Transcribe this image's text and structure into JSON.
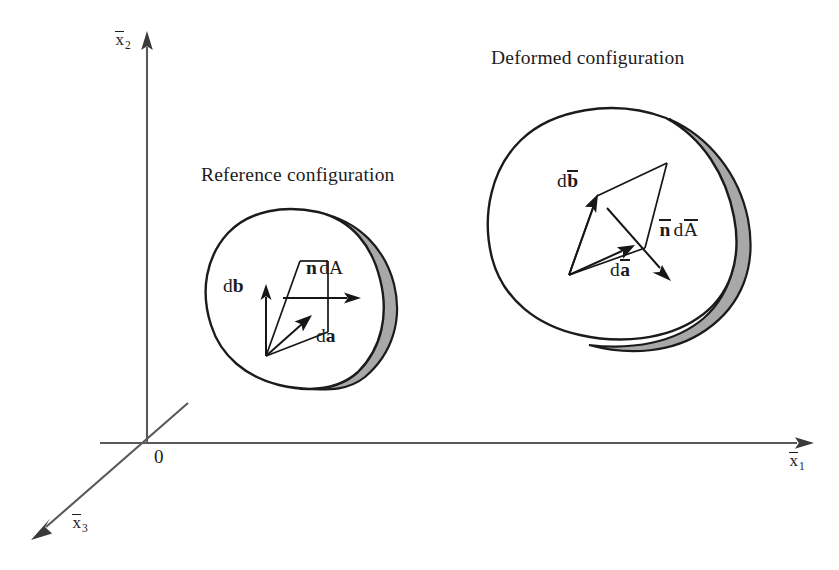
{
  "figure": {
    "background_color": "#ffffff",
    "ink_color": "#1c1c1c",
    "axis_color": "#595959",
    "band_fill_color": "#a8a8a8",
    "body_fill_color": "#ffffff"
  },
  "axes": {
    "origin_label": "0",
    "vertical": {
      "symbol": "x",
      "overbar": true,
      "subscript": "2",
      "direction": "up"
    },
    "horizontal": {
      "symbol": "x",
      "overbar": true,
      "subscript": "1",
      "direction": "right"
    },
    "oblique": {
      "symbol": "x",
      "overbar": true,
      "subscript": "3",
      "direction": "down-left"
    }
  },
  "bodies": [
    {
      "name": "reference-configuration",
      "caption": "Reference configuration",
      "vectors": [
        {
          "name": "db",
          "prefix": "d",
          "symbol": "b",
          "bold": true,
          "overbar": false,
          "direction": "up"
        },
        {
          "name": "da",
          "prefix": "d",
          "symbol": "a",
          "bold": true,
          "overbar": false,
          "direction": "up-right"
        },
        {
          "name": "ndA",
          "prefix": "",
          "symbol": "n",
          "bold": true,
          "overbar": false,
          "suffix": "dA",
          "direction": "right"
        }
      ]
    },
    {
      "name": "deformed-configuration",
      "caption": "Deformed configuration",
      "vectors": [
        {
          "name": "dbbar",
          "prefix": "d",
          "symbol": "b",
          "bold": true,
          "overbar": true,
          "direction": "up-right"
        },
        {
          "name": "dabar",
          "prefix": "d",
          "symbol": "a",
          "bold": true,
          "overbar": true,
          "direction": "up-right-shallow"
        },
        {
          "name": "nbardAbar",
          "prefix": "",
          "symbol": "n",
          "bold": true,
          "overbar": true,
          "suffix": "dA",
          "suffix_overbar": true,
          "direction": "down-right"
        }
      ]
    }
  ],
  "labels": {
    "reference_caption": "Reference configuration",
    "deformed_caption": "Deformed configuration",
    "origin": "0",
    "axis_x1_base": "x",
    "axis_x1_sub": "1",
    "axis_x2_base": "x",
    "axis_x2_sub": "2",
    "axis_x3_base": "x",
    "axis_x3_sub": "3",
    "ref_db_d": "d",
    "ref_db_sym": "b",
    "ref_da_d": "d",
    "ref_da_sym": "a",
    "ref_n": "n",
    "ref_dA": "dA",
    "def_db_d": "d",
    "def_db_sym": "b",
    "def_da_d": "d",
    "def_da_sym": "a",
    "def_n": "n",
    "def_d": "d",
    "def_A": "A"
  }
}
